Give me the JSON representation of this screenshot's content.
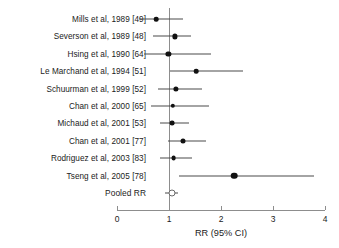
{
  "chart_data": {
    "type": "scatter",
    "subtype": "forest-plot",
    "title": "",
    "xlabel": "RR (95% CI)",
    "ylabel": "",
    "xlim": [
      0,
      4
    ],
    "xticks": [
      0,
      1,
      2,
      3,
      4
    ],
    "xtick_labels": [
      "0",
      "1",
      "2",
      "3",
      "4"
    ],
    "grid": false,
    "legend": "none",
    "reference_line": 1,
    "marker_color": "#111111",
    "line_color": "#4a4a4a",
    "axis_color": "#8d8d8d",
    "categories": [
      "Mills et al, 1989 [49]",
      "Severson et al, 1989 [48]",
      "Hsing et al, 1990 [64]",
      "Le Marchand et al, 1994 [51]",
      "Schuurman et al, 1999 [52]",
      "Chan et al, 2000 [65]",
      "Michaud et al, 2001 [53]",
      "Chan et al, 2001 [77]",
      "Rodriguez et al, 2003 [83]",
      "Tseng et al, 2005 [78]",
      "Pooled RR"
    ],
    "points": [
      {
        "label": "Mills et al, 1989 [49]",
        "rr": 0.75,
        "ci_low": 0.42,
        "ci_high": 1.27,
        "marker": "filled",
        "size": 4.6
      },
      {
        "label": "Severson et al, 1989 [48]",
        "rr": 1.12,
        "ci_low": 0.7,
        "ci_high": 1.42,
        "marker": "filled",
        "size": 5.2
      },
      {
        "label": "Hsing et al, 1990 [64]",
        "rr": 0.99,
        "ci_low": 0.52,
        "ci_high": 1.81,
        "marker": "filled",
        "size": 5.2
      },
      {
        "label": "Le Marchand et al, 1994 [51]",
        "rr": 1.52,
        "ci_low": 1.02,
        "ci_high": 2.42,
        "marker": "filled",
        "size": 4.6
      },
      {
        "label": "Schuurman et al, 1999 [52]",
        "rr": 1.14,
        "ci_low": 0.79,
        "ci_high": 1.64,
        "marker": "filled",
        "size": 5.2
      },
      {
        "label": "Chan et al, 2000 [65]",
        "rr": 1.07,
        "ci_low": 0.65,
        "ci_high": 1.76,
        "marker": "filled",
        "size": 4.4
      },
      {
        "label": "Michaud et al, 2001 [53]",
        "rr": 1.06,
        "ci_low": 0.83,
        "ci_high": 1.38,
        "marker": "filled",
        "size": 4.8
      },
      {
        "label": "Chan et al, 2001 [77]",
        "rr": 1.26,
        "ci_low": 0.98,
        "ci_high": 1.72,
        "marker": "filled",
        "size": 5.0
      },
      {
        "label": "Rodriguez et al, 2003 [83]",
        "rr": 1.09,
        "ci_low": 0.82,
        "ci_high": 1.45,
        "marker": "filled",
        "size": 4.8
      },
      {
        "label": "Tseng et al, 2005 [78]",
        "rr": 2.25,
        "ci_low": 1.19,
        "ci_high": 3.79,
        "marker": "filled",
        "size": 6.6
      },
      {
        "label": "Pooled RR",
        "rr": 1.05,
        "ci_low": 0.93,
        "ci_high": 1.18,
        "marker": "open",
        "size": 5.0
      }
    ]
  },
  "axis": {
    "xlabel": "RR (95% CI)"
  }
}
